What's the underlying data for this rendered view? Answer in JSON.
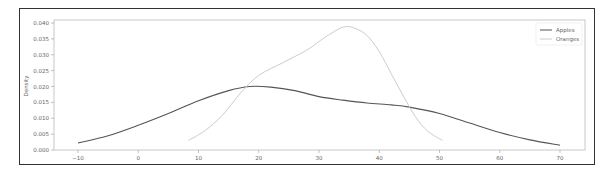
{
  "chart_data": {
    "type": "line",
    "title": "",
    "xlabel": "",
    "ylabel": "Density",
    "xlim": [
      -13,
      72
    ],
    "ylim": [
      0,
      0.041
    ],
    "grid": false,
    "legend_position": "upper right",
    "x_ticks": [
      "-10",
      "0",
      "10",
      "20",
      "30",
      "40",
      "50",
      "60",
      "70"
    ],
    "y_ticks": [
      "0.000",
      "0.005",
      "0.010",
      "0.015",
      "0.020",
      "0.025",
      "0.030",
      "0.035",
      "0.040"
    ],
    "series": [
      {
        "name": "Apples",
        "color": "#555555",
        "x": [
          -10,
          -5,
          0,
          5,
          10,
          15,
          18.5,
          22,
          26,
          30,
          34,
          38,
          42,
          45,
          50,
          55,
          60,
          65,
          70
        ],
        "y": [
          0.0022,
          0.0045,
          0.0078,
          0.0115,
          0.0155,
          0.0187,
          0.02,
          0.0198,
          0.0187,
          0.0168,
          0.0157,
          0.0148,
          0.0142,
          0.0135,
          0.0115,
          0.0085,
          0.0055,
          0.0032,
          0.0015
        ]
      },
      {
        "name": "Oranges",
        "color": "#cccccc",
        "x": [
          8.3,
          11,
          14,
          17,
          20,
          24,
          28,
          31,
          34,
          36,
          38,
          40,
          42,
          44,
          46,
          48,
          50.5
        ],
        "y": [
          0.003,
          0.006,
          0.011,
          0.018,
          0.0235,
          0.0275,
          0.0315,
          0.0355,
          0.0387,
          0.0383,
          0.036,
          0.031,
          0.024,
          0.017,
          0.0105,
          0.006,
          0.003
        ]
      }
    ]
  },
  "legend": {
    "items": [
      {
        "label": "Apples",
        "color": "#555555"
      },
      {
        "label": "Oranges",
        "color": "#cccccc"
      }
    ]
  },
  "axes": {
    "ylabel": "Density"
  }
}
